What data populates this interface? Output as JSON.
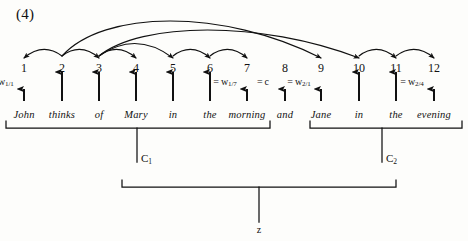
{
  "figure": {
    "example_number": "(4)",
    "domain_note": "linguistic dependency arc diagram with constituent brackets"
  },
  "nodes": [
    {
      "id": "1",
      "x": 24,
      "label": "1",
      "word": "John",
      "eq": "w",
      "eq_sub": "1/1"
    },
    {
      "id": "2",
      "x": 62,
      "label": "2",
      "word": "thinks",
      "eq": "",
      "eq_sub": ""
    },
    {
      "id": "3",
      "x": 99,
      "label": "3",
      "word": "of",
      "eq": "",
      "eq_sub": ""
    },
    {
      "id": "4",
      "x": 136,
      "label": "4",
      "word": "Mary",
      "eq": "",
      "eq_sub": ""
    },
    {
      "id": "5",
      "x": 173,
      "label": "5",
      "word": "in",
      "eq": "",
      "eq_sub": ""
    },
    {
      "id": "6",
      "x": 210,
      "label": "6",
      "word": "the",
      "eq": "",
      "eq_sub": ""
    },
    {
      "id": "7",
      "x": 247,
      "label": "7",
      "word": "morning",
      "eq": "w",
      "eq_sub": "1/7"
    },
    {
      "id": "8",
      "x": 285,
      "label": "8",
      "word": "and",
      "eq": "c",
      "eq_sub": ""
    },
    {
      "id": "9",
      "x": 321,
      "label": "9",
      "word": "Jane",
      "eq": "w",
      "eq_sub": "2/1"
    },
    {
      "id": "10",
      "x": 359,
      "label": "10",
      "word": "in",
      "eq": "",
      "eq_sub": ""
    },
    {
      "id": "11",
      "x": 396,
      "label": "11",
      "word": "the",
      "eq": "",
      "eq_sub": ""
    },
    {
      "id": "12",
      "x": 434,
      "label": "12",
      "word": "evening",
      "eq": "w",
      "eq_sub": "2/4"
    }
  ],
  "arcs": [
    {
      "from": "2",
      "to": "1",
      "direction": "left",
      "span": "short"
    },
    {
      "from": "2",
      "to": "3",
      "direction": "right",
      "span": "short"
    },
    {
      "from": "3",
      "to": "4",
      "direction": "right",
      "span": "short"
    },
    {
      "from": "5",
      "to": "6",
      "direction": "right",
      "span": "short"
    },
    {
      "from": "6",
      "to": "7",
      "direction": "right",
      "span": "short"
    },
    {
      "from": "10",
      "to": "11",
      "direction": "right",
      "span": "short"
    },
    {
      "from": "11",
      "to": "12",
      "direction": "right",
      "span": "short"
    },
    {
      "from": "3",
      "to": "5",
      "direction": "right",
      "span": "medium"
    },
    {
      "from": "2",
      "to": "9",
      "direction": "right",
      "span": "long"
    },
    {
      "from": "3",
      "to": "10",
      "direction": "right",
      "span": "long"
    }
  ],
  "brackets": [
    {
      "name": "C1",
      "label_text": "C",
      "label_sub": "1",
      "left_x": 6,
      "right_x": 270,
      "stem_x": 137,
      "top_y": 128,
      "bottom_y": 162
    },
    {
      "name": "C2",
      "label_text": "C",
      "label_sub": "2",
      "left_x": 310,
      "right_x": 462,
      "stem_x": 382,
      "top_y": 128,
      "bottom_y": 162
    },
    {
      "name": "Z",
      "label_text": "z",
      "label_sub": "",
      "left_x": 122,
      "right_x": 396,
      "stem_x": 259,
      "top_y": 187,
      "bottom_y": 222
    }
  ],
  "colors": {
    "ink": "#111111",
    "paper": "#fdfdfb"
  },
  "geometry": {
    "node_num_y": 62,
    "arrow_tail_y": 101,
    "arrow_head_y": 72,
    "word_y": 110,
    "eq_y": 77,
    "arc_base_y": 52
  }
}
